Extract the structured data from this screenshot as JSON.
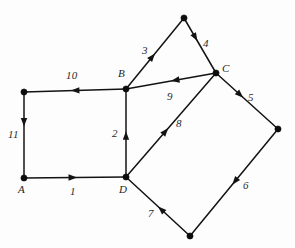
{
  "figure": {
    "type": "directed-weighted-graph",
    "background_color": "#fdfdfd",
    "stroke_color": "#131313",
    "text_color": "#2a2a2a",
    "width": 295,
    "height": 248
  },
  "vertices": [
    {
      "id": "P0",
      "label": "",
      "x": 24,
      "y": 92,
      "label_x": 0,
      "label_y": 0,
      "has_label": false
    },
    {
      "id": "A",
      "label": "A",
      "x": 24,
      "y": 178,
      "label_x": 18,
      "label_y": 184,
      "has_label": true
    },
    {
      "id": "B",
      "label": "B",
      "x": 126,
      "y": 89,
      "label_x": 118,
      "label_y": 68,
      "has_label": true
    },
    {
      "id": "D",
      "label": "D",
      "x": 126,
      "y": 177,
      "label_x": 119,
      "label_y": 184,
      "has_label": true
    },
    {
      "id": "P4",
      "label": "",
      "x": 184,
      "y": 18,
      "label_x": 0,
      "label_y": 0,
      "has_label": false
    },
    {
      "id": "C",
      "label": "C",
      "x": 216,
      "y": 73,
      "label_x": 222,
      "label_y": 63,
      "has_label": true
    },
    {
      "id": "P6",
      "label": "",
      "x": 278,
      "y": 129,
      "label_x": 0,
      "label_y": 0,
      "has_label": false
    },
    {
      "id": "P7",
      "label": "",
      "x": 190,
      "y": 236,
      "label_x": 0,
      "label_y": 0,
      "has_label": false
    }
  ],
  "edges": [
    {
      "id": "e1",
      "weight": "1",
      "from": "A",
      "to": "D",
      "x1": 24,
      "y1": 178,
      "x2": 126,
      "y2": 177,
      "arrow_t": 0.52,
      "label_x": 70,
      "label_y": 186
    },
    {
      "id": "e2",
      "weight": "2",
      "from": "D",
      "to": "B",
      "x1": 126,
      "y1": 177,
      "x2": 126,
      "y2": 89,
      "arrow_t": 0.52,
      "label_x": 112,
      "label_y": 128
    },
    {
      "id": "e3",
      "weight": "3",
      "from": "B",
      "to": "P4",
      "x1": 126,
      "y1": 89,
      "x2": 184,
      "y2": 18,
      "arrow_t": 0.5,
      "label_x": 142,
      "label_y": 45
    },
    {
      "id": "e4",
      "weight": "4",
      "from": "P4",
      "to": "C",
      "x1": 184,
      "y1": 18,
      "x2": 216,
      "y2": 73,
      "arrow_t": 0.42,
      "label_x": 203,
      "label_y": 38
    },
    {
      "id": "e5",
      "weight": "5",
      "from": "C",
      "to": "P6",
      "x1": 216,
      "y1": 73,
      "x2": 278,
      "y2": 129,
      "arrow_t": 0.44,
      "label_x": 248,
      "label_y": 92
    },
    {
      "id": "e6",
      "weight": "6",
      "from": "P6",
      "to": "P7",
      "x1": 278,
      "y1": 129,
      "x2": 190,
      "y2": 236,
      "arrow_t": 0.52,
      "label_x": 243,
      "label_y": 180
    },
    {
      "id": "e7",
      "weight": "7",
      "from": "P7",
      "to": "D",
      "x1": 190,
      "y1": 236,
      "x2": 126,
      "y2": 177,
      "arrow_t": 0.5,
      "label_x": 148,
      "label_y": 208
    },
    {
      "id": "e8",
      "weight": "8",
      "from": "D",
      "to": "C",
      "x1": 126,
      "y1": 177,
      "x2": 216,
      "y2": 73,
      "arrow_t": 0.47,
      "label_x": 176,
      "label_y": 118
    },
    {
      "id": "e9",
      "weight": "9",
      "from": "C",
      "to": "B",
      "x1": 216,
      "y1": 73,
      "x2": 126,
      "y2": 89,
      "arrow_t": 0.5,
      "label_x": 167,
      "label_y": 91
    },
    {
      "id": "e10",
      "weight": "10",
      "from": "B",
      "to": "P0",
      "x1": 126,
      "y1": 89,
      "x2": 24,
      "y2": 92,
      "arrow_t": 0.54,
      "label_x": 66,
      "label_y": 70
    },
    {
      "id": "e11",
      "weight": "11",
      "from": "P0",
      "to": "A",
      "x1": 24,
      "y1": 92,
      "x2": 24,
      "y2": 178,
      "arrow_t": 0.4,
      "label_x": 8,
      "label_y": 129
    }
  ]
}
